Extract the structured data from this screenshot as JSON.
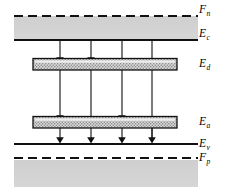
{
  "figure": {
    "type": "energy-band-diagram",
    "title": "",
    "width": 229,
    "height": 193,
    "background_color": "#ffffff",
    "line_color": "#000000",
    "band_fill_color": "#d2d2d2",
    "level_fill_color": "#d9d9d9"
  },
  "labels": {
    "fn": {
      "base": "F",
      "sub": "n",
      "x": 199,
      "y": 10
    },
    "ec": {
      "base": "E",
      "sub": "c",
      "x": 199,
      "y": 34
    },
    "ed": {
      "base": "E",
      "sub": "d",
      "x": 199,
      "y": 59
    },
    "ea": {
      "base": "E",
      "sub": "a",
      "x": 199,
      "y": 117
    },
    "ev": {
      "base": "E",
      "sub": "v",
      "x": 199,
      "y": 139
    },
    "fp": {
      "base": "F",
      "sub": "p",
      "x": 199,
      "y": 153
    }
  },
  "levels": [
    {
      "name": "fn-quasi-fermi-level",
      "label": "F_n",
      "style": "dashed",
      "y": 16,
      "x1": 14,
      "x2": 198
    },
    {
      "name": "ec-conduction-band-edge",
      "label": "E_c",
      "style": "solid",
      "y": 40,
      "x1": 14,
      "x2": 198
    },
    {
      "name": "ed-donor-level",
      "label": "E_d",
      "style": "filled-bar",
      "y": 64,
      "x1": 33,
      "x2": 177
    },
    {
      "name": "ea-acceptor-level",
      "label": "E_a",
      "style": "filled-bar",
      "y": 122,
      "x1": 33,
      "x2": 177
    },
    {
      "name": "ev-valence-band-edge",
      "label": "E_v",
      "style": "solid",
      "y": 144,
      "x1": 14,
      "x2": 198
    },
    {
      "name": "fp-quasi-fermi-level",
      "label": "F_p",
      "style": "dashed",
      "y": 158,
      "x1": 14,
      "x2": 198
    }
  ],
  "shaded_regions": [
    {
      "name": "conduction-band-region",
      "x": 14,
      "y": 16,
      "width": 184,
      "height": 24
    },
    {
      "name": "valence-band-region",
      "x": 14,
      "y": 160,
      "width": 184,
      "height": 27
    }
  ],
  "transitions": [
    {
      "name": "transition-1",
      "x": 60,
      "from_y": 40,
      "to_y": 64,
      "arrowhead": "end"
    },
    {
      "name": "transition-2",
      "x": 91,
      "from_y": 40,
      "to_y": 64,
      "arrowhead": "end"
    },
    {
      "name": "transition-3",
      "x": 122,
      "from_y": 40,
      "to_y": 144,
      "arrowhead": "end"
    },
    {
      "name": "transition-4",
      "x": 152,
      "from_y": 40,
      "to_y": 144,
      "arrowhead": "end"
    },
    {
      "name": "transition-5",
      "x": 60,
      "from_y": 64,
      "to_y": 122,
      "arrowhead": "end"
    },
    {
      "name": "transition-6",
      "x": 122,
      "from_y": 64,
      "to_y": 122,
      "arrowhead": "end"
    },
    {
      "name": "transition-7",
      "x": 60,
      "from_y": 122,
      "to_y": 144,
      "arrowhead": "end"
    },
    {
      "name": "transition-8",
      "x": 91,
      "from_y": 64,
      "to_y": 144,
      "arrowhead": "end"
    },
    {
      "name": "transition-9",
      "x": 122,
      "from_y": 122,
      "to_y": 144,
      "arrowhead": "end"
    },
    {
      "name": "transition-10",
      "x": 152,
      "from_y": 64,
      "to_y": 144,
      "arrowhead": "end"
    }
  ]
}
